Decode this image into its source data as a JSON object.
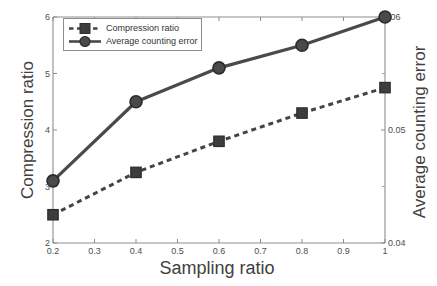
{
  "chart_data": {
    "type": "line",
    "title": "",
    "xlabel": "Sampling ratio",
    "ylabel": "Compression ratio",
    "y2label": "Average counting error",
    "x": [
      0.2,
      0.4,
      0.6,
      0.8,
      1.0
    ],
    "xlim": [
      0.2,
      1.0
    ],
    "xticks": [
      "0.2",
      "0.3",
      "0.4",
      "0.5",
      "0.6",
      "0.7",
      "0.8",
      "0.9",
      "1"
    ],
    "xtick_values": [
      0.2,
      0.3,
      0.4,
      0.5,
      0.6,
      0.7,
      0.8,
      0.9,
      1.0
    ],
    "ylim": [
      2,
      6
    ],
    "yticks": [
      "2",
      "3",
      "4",
      "5",
      "6"
    ],
    "ytick_values": [
      2,
      3,
      4,
      5,
      6
    ],
    "y2lim": [
      0.04,
      0.06
    ],
    "y2ticks": [
      "0.04",
      "0.05",
      ".06"
    ],
    "y2tick_values": [
      0.04,
      0.05,
      0.06
    ],
    "y2_minor_ticks": [
      0.045,
      0.055
    ],
    "grid": false,
    "legend_position": "top-left",
    "series": [
      {
        "name": "Compression ratio",
        "axis": "left",
        "marker": "square",
        "linestyle": "dashed",
        "color": "#444444",
        "values": [
          2.5,
          3.25,
          3.8,
          4.3,
          4.75
        ]
      },
      {
        "name": "Average counting error",
        "axis": "right",
        "marker": "circle",
        "linestyle": "solid",
        "color": "#4a4a4a",
        "values": [
          0.0455,
          0.0525,
          0.0555,
          0.0575,
          0.06
        ]
      }
    ]
  },
  "legend": {
    "items": [
      {
        "label": "Compression ratio"
      },
      {
        "label": "Average counting error"
      }
    ]
  },
  "colors": {
    "line": "#4a4a4a",
    "axis": "#8d8d8d",
    "text": "#404040",
    "background": "#ffffff"
  }
}
